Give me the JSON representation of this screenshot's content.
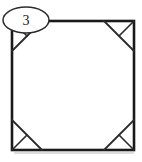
{
  "figure": {
    "background_color": "#ffffff",
    "line_color": "#1a1a1a",
    "callout": {
      "label": "3",
      "shape": "ellipse",
      "fill_color": "#ffffff",
      "stroke_color": "#2b2b2b",
      "center_x": 26,
      "center_y": 20,
      "radius_x": 23,
      "radius_y": 13
    },
    "square": {
      "left": 12,
      "top": 21,
      "right": 134,
      "bottom": 150,
      "stroke_width": 2.6
    },
    "corner_cut_length": 30,
    "corners": [
      {
        "name": "top-left",
        "cut_from_x": 12,
        "cut_from_y": 51,
        "cut_to_x": 42,
        "cut_to_y": 21,
        "apex_x": 12,
        "apex_y": 21,
        "mid_x": 27,
        "mid_y": 36
      },
      {
        "name": "top-right",
        "cut_from_x": 104,
        "cut_from_y": 21,
        "cut_to_x": 134,
        "cut_to_y": 51,
        "apex_x": 134,
        "apex_y": 21,
        "mid_x": 119,
        "mid_y": 36
      },
      {
        "name": "bottom-right",
        "cut_from_x": 134,
        "cut_from_y": 120,
        "cut_to_x": 104,
        "cut_to_y": 150,
        "apex_x": 134,
        "apex_y": 150,
        "mid_x": 119,
        "mid_y": 135
      },
      {
        "name": "bottom-left",
        "cut_from_x": 42,
        "cut_from_y": 150,
        "cut_to_x": 12,
        "cut_to_y": 120,
        "apex_x": 12,
        "apex_y": 150,
        "mid_x": 27,
        "mid_y": 135
      }
    ]
  }
}
